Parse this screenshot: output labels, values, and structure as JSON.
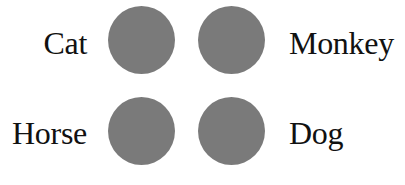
{
  "diagram": {
    "fill_color": "#7a7a7a",
    "items": [
      {
        "label": "Cat",
        "position": "top-left"
      },
      {
        "label": "Monkey",
        "position": "top-right"
      },
      {
        "label": "Horse",
        "position": "bottom-left"
      },
      {
        "label": "Dog",
        "position": "bottom-right"
      }
    ]
  }
}
